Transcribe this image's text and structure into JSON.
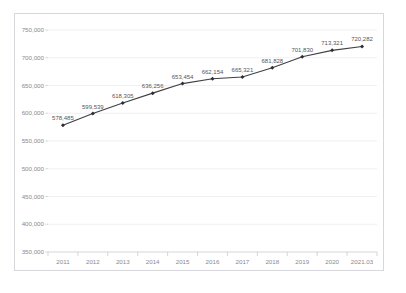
{
  "chart_data": {
    "type": "line",
    "title": "",
    "xlabel": "",
    "ylabel": "",
    "categories": [
      "2011",
      "2012",
      "2013",
      "2014",
      "2015",
      "2016",
      "2017",
      "2018",
      "2019",
      "2020",
      "2021.03"
    ],
    "values": [
      578485,
      599539,
      618305,
      636256,
      653454,
      662154,
      665321,
      681828,
      701830,
      713321,
      720282
    ],
    "point_labels": [
      "578,485",
      "599,539",
      "618,305",
      "636,256",
      "653,454",
      "662,154",
      "665,321",
      "681,828",
      "701,830",
      "713,321",
      "720,282"
    ],
    "ylim": [
      350000,
      750000
    ],
    "ytick_values": [
      350000,
      400000,
      450000,
      500000,
      550000,
      600000,
      650000,
      700000,
      750000
    ],
    "ytick_labels": [
      "350,000",
      "400,000",
      "450,000",
      "500,000",
      "550,000",
      "600,000",
      "650,000",
      "700,000",
      "750,000"
    ],
    "grid": true,
    "legend": "none",
    "series": [
      {
        "name": "series-1",
        "values": [
          578485,
          599539,
          618305,
          636256,
          653454,
          662154,
          665321,
          681828,
          701830,
          713321,
          720282
        ]
      }
    ],
    "colors": {
      "line": "#3f3f46",
      "marker": "#2e2e34",
      "grid": "#e9e9ed",
      "axis": "#c4c4ca",
      "frame": "#d8d8dc",
      "tick_text": "#8a8a90",
      "label_text": "#55555c"
    }
  }
}
